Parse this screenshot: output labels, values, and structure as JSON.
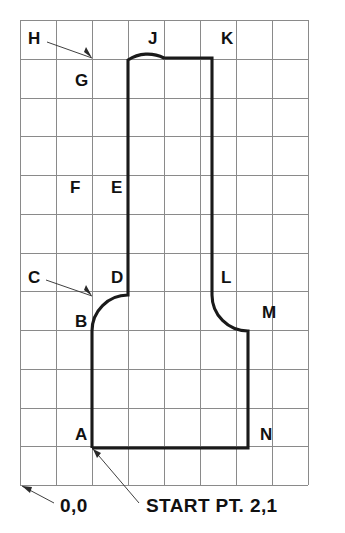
{
  "drawing": {
    "title": "Grid profile layout with lettered vertices",
    "background_color": "#ffffff",
    "grid": {
      "line_color": "#8a8a8a",
      "origin_x": 20,
      "origin_y": 20,
      "cell_width": 36,
      "cell_height": 38.75,
      "columns": 8,
      "rows": 12,
      "visible": true
    },
    "profile": {
      "stroke_color": "#1a1a1a",
      "stroke_width": 3.1,
      "closed": false,
      "path": "M 92 448 L 92 331 A 36 36 0 0 1 128 295 L 128 175 L 128 60 A 36 36 0 0 1 164 58 L 212 58 L 212 295 A 36 36 0 0 0 248 331 L 248 448 L 92 448"
    },
    "vertices": [
      {
        "id": "A",
        "label": "A",
        "x": 75,
        "y": 440
      },
      {
        "id": "B",
        "label": "B",
        "x": 75,
        "y": 327
      },
      {
        "id": "C",
        "label": "C",
        "x": 28,
        "y": 283
      },
      {
        "id": "D",
        "label": "D",
        "x": 111,
        "y": 283
      },
      {
        "id": "E",
        "label": "E",
        "x": 111,
        "y": 193
      },
      {
        "id": "F",
        "label": "F",
        "x": 70,
        "y": 193
      },
      {
        "id": "G",
        "label": "G",
        "x": 75,
        "y": 86
      },
      {
        "id": "H",
        "label": "H",
        "x": 28,
        "y": 44
      },
      {
        "id": "J",
        "label": "J",
        "x": 148,
        "y": 44
      },
      {
        "id": "K",
        "label": "K",
        "x": 221,
        "y": 44
      },
      {
        "id": "L",
        "label": "L",
        "x": 221,
        "y": 283
      },
      {
        "id": "M",
        "label": "M",
        "x": 262,
        "y": 318
      },
      {
        "id": "N",
        "label": "N",
        "x": 260,
        "y": 440
      }
    ],
    "leaders": [
      {
        "name": "leader-h",
        "from_label": "H",
        "path": "M 47 42 L 92 58",
        "arrow_points": "92,58 84,52 86,47"
      },
      {
        "name": "leader-c",
        "from_label": "C",
        "path": "M 46 280 L 92 296",
        "arrow_points": "92,296 84,290 86,285"
      },
      {
        "name": "leader-origin",
        "from_label": "0,0",
        "path": "M 54 503 L 22 486",
        "arrow_points": "22,486 32,487 30,493"
      },
      {
        "name": "leader-start-point",
        "from_label": "START PT. 2,1",
        "path": "M 139 503 L 93 449",
        "arrow_points": "93,449 101,453 97,458"
      }
    ],
    "annotations": [
      {
        "id": "origin",
        "text": "0,0",
        "x": 60,
        "y": 512
      },
      {
        "id": "start-point",
        "text": "START PT. 2,1",
        "x": 146,
        "y": 512
      }
    ]
  }
}
